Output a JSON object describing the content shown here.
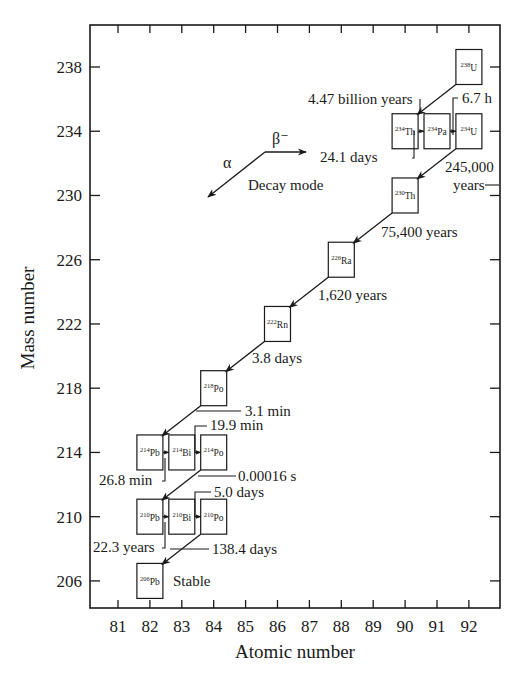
{
  "chart_data": {
    "type": "diagram",
    "title": "",
    "xlabel": "Atomic number",
    "ylabel": "Mass number",
    "x_ticks": [
      81,
      82,
      83,
      84,
      85,
      86,
      87,
      88,
      89,
      90,
      91,
      92
    ],
    "y_ticks": [
      206,
      210,
      214,
      218,
      222,
      226,
      230,
      234,
      238
    ],
    "xlim": [
      80.1,
      93
    ],
    "ylim": [
      204.7,
      240.6
    ],
    "legend": {
      "alpha_label": "α",
      "beta_label": "β⁻",
      "caption": "Decay mode"
    },
    "nuclides": [
      {
        "mass": "238",
        "symbol": "U",
        "Z": 92,
        "A": 238
      },
      {
        "mass": "234",
        "symbol": "Th",
        "Z": 90,
        "A": 234
      },
      {
        "mass": "234",
        "symbol": "Pa",
        "Z": 91,
        "A": 234
      },
      {
        "mass": "234",
        "symbol": "U",
        "Z": 92,
        "A": 234
      },
      {
        "mass": "230",
        "symbol": "Th",
        "Z": 90,
        "A": 230
      },
      {
        "mass": "226",
        "symbol": "Ra",
        "Z": 88,
        "A": 226
      },
      {
        "mass": "222",
        "symbol": "Rn",
        "Z": 86,
        "A": 222
      },
      {
        "mass": "218",
        "symbol": "Po",
        "Z": 84,
        "A": 218
      },
      {
        "mass": "214",
        "symbol": "Pb",
        "Z": 82,
        "A": 214
      },
      {
        "mass": "214",
        "symbol": "Bi",
        "Z": 83,
        "A": 214
      },
      {
        "mass": "214",
        "symbol": "Po",
        "Z": 84,
        "A": 214
      },
      {
        "mass": "210",
        "symbol": "Pb",
        "Z": 82,
        "A": 210
      },
      {
        "mass": "210",
        "symbol": "Bi",
        "Z": 83,
        "A": 210
      },
      {
        "mass": "210",
        "symbol": "Po",
        "Z": 84,
        "A": 210
      },
      {
        "mass": "206",
        "symbol": "Pb",
        "Z": 82,
        "A": 206
      }
    ],
    "decays": [
      {
        "from": "238U",
        "to": "234Th",
        "mode": "alpha",
        "half_life": "4.47 billion years"
      },
      {
        "from": "234Th",
        "to": "234Pa",
        "mode": "beta",
        "half_life": "24.1 days"
      },
      {
        "from": "234Pa",
        "to": "234U",
        "mode": "beta",
        "half_life": "6.7 h"
      },
      {
        "from": "234U",
        "to": "230Th",
        "mode": "alpha",
        "half_life": "245,000 years"
      },
      {
        "from": "230Th",
        "to": "226Ra",
        "mode": "alpha",
        "half_life": "75,400 years"
      },
      {
        "from": "226Ra",
        "to": "222Rn",
        "mode": "alpha",
        "half_life": "1,620 years"
      },
      {
        "from": "222Rn",
        "to": "218Po",
        "mode": "alpha",
        "half_life": "3.8 days"
      },
      {
        "from": "218Po",
        "to": "214Pb",
        "mode": "alpha",
        "half_life": "3.1 min"
      },
      {
        "from": "214Pb",
        "to": "214Bi",
        "mode": "beta",
        "half_life": "26.8 min"
      },
      {
        "from": "214Bi",
        "to": "214Po",
        "mode": "beta",
        "half_life": "19.9 min"
      },
      {
        "from": "214Po",
        "to": "210Pb",
        "mode": "alpha",
        "half_life": "0.00016 s"
      },
      {
        "from": "210Pb",
        "to": "210Bi",
        "mode": "beta",
        "half_life": "22.3 years"
      },
      {
        "from": "210Bi",
        "to": "210Po",
        "mode": "beta",
        "half_life": "5.0 days"
      },
      {
        "from": "210Po",
        "to": "206Pb",
        "mode": "alpha",
        "half_life": "138.4 days"
      }
    ],
    "stable_label": "Stable",
    "grid": false
  },
  "labels": {
    "half_lives": {
      "u238": "4.47 billion years",
      "th234": "24.1 days",
      "pa234": "6.7 h",
      "u234_line1": "245,000",
      "u234_line2": "years",
      "th230": "75,400 years",
      "ra226": "1,620 years",
      "rn222": "3.8 days",
      "po218": "3.1 min",
      "pb214": "26.8 min",
      "bi214": "19.9 min",
      "po214": "0.00016 s",
      "pb210": "22.3 years",
      "bi210": "5.0 days",
      "po210": "138.4 days"
    }
  },
  "colors": {
    "ink": "#1a1a1a",
    "background": "#ffffff"
  }
}
